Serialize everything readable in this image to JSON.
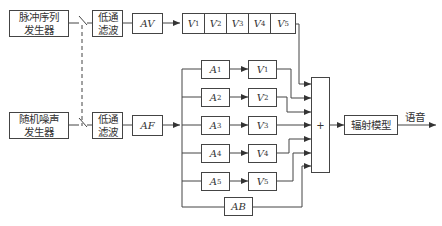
{
  "diagram": {
    "type": "block-diagram",
    "title": "",
    "blocks": {
      "pulse_generator": "脉冲序列\n发生器",
      "noise_generator": "随机噪声\n发生器",
      "lowpass_top": "低通\n滤波",
      "lowpass_bottom": "低通\n滤波",
      "av": "AV",
      "af": "AF",
      "ab": "AB",
      "sum": "+",
      "radiation": "辐射模型"
    },
    "voiced_chain": [
      {
        "name": "V",
        "sub": "1"
      },
      {
        "name": "V",
        "sub": "2"
      },
      {
        "name": "V",
        "sub": "3"
      },
      {
        "name": "V",
        "sub": "4"
      },
      {
        "name": "V",
        "sub": "5"
      }
    ],
    "parallel_branches": [
      {
        "a": "A",
        "a_sub": "1",
        "v": "V",
        "v_sub": "1"
      },
      {
        "a": "A",
        "a_sub": "2",
        "v": "V",
        "v_sub": "2"
      },
      {
        "a": "A",
        "a_sub": "3",
        "v": "V",
        "v_sub": "3"
      },
      {
        "a": "A",
        "a_sub": "4",
        "v": "V",
        "v_sub": "4"
      },
      {
        "a": "A",
        "a_sub": "5",
        "v": "V",
        "v_sub": "5"
      }
    ],
    "output_label": "语音",
    "colors": {
      "line": "#444444",
      "background": "#ffffff"
    }
  }
}
